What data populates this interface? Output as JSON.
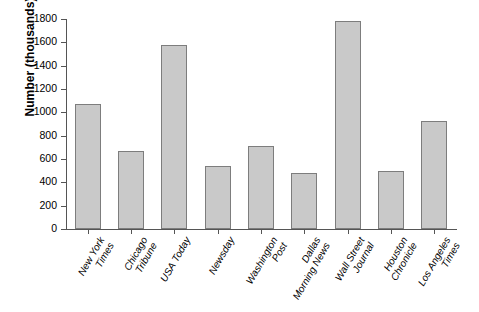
{
  "chart_data": {
    "type": "bar",
    "title": "",
    "xlabel": "",
    "ylabel": "Number (thousands)",
    "ylim": [
      0,
      1800
    ],
    "ytick_step": 200,
    "yticks": [
      0,
      200,
      400,
      600,
      800,
      1000,
      1200,
      1400,
      1600,
      1800
    ],
    "grid": false,
    "legend": "none",
    "bar_color": "#c9c9c9",
    "bar_edge_color": "#7d7d7d",
    "axis_color": "#555555",
    "categories": [
      "New York Times",
      "Chicago Tribune",
      "USA Today",
      "Newsday",
      "Washington Post",
      "Dallas Morning News",
      "Wall Street Journal",
      "Houston Chronicle",
      "Los Angeles Times"
    ],
    "category_lines": [
      [
        "New York",
        "Times"
      ],
      [
        "Chicago",
        "Tribune"
      ],
      [
        "USA Today"
      ],
      [
        "Newsday"
      ],
      [
        "Washington",
        "Post"
      ],
      [
        "Dallas",
        "Morning News"
      ],
      [
        "Wall Street",
        "Journal"
      ],
      [
        "Houston",
        "Chronicle"
      ],
      [
        "Los Angeles",
        "Times"
      ]
    ],
    "values": [
      1070,
      670,
      1575,
      540,
      715,
      480,
      1780,
      500,
      925
    ]
  }
}
